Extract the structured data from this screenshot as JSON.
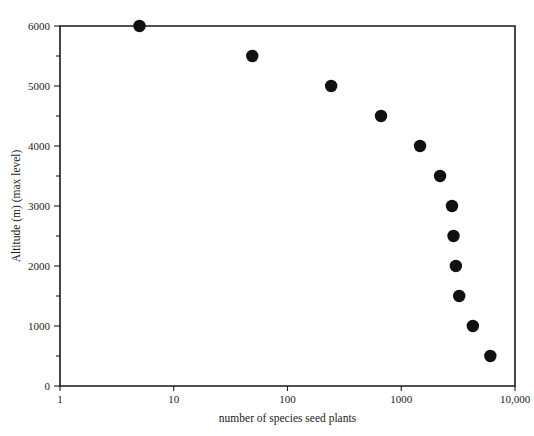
{
  "chart_data": {
    "type": "scatter",
    "title": "",
    "xlabel": "number of species seed plants",
    "ylabel": "Altitude (m) (max level)",
    "x_scale": "log",
    "y_scale": "linear",
    "xlim": [
      1,
      10000
    ],
    "ylim": [
      0,
      6000
    ],
    "grid": false,
    "legend": null,
    "x_ticks": [
      {
        "value": 1,
        "label": "1"
      },
      {
        "value": 10,
        "label": "10"
      },
      {
        "value": 100,
        "label": "100"
      },
      {
        "value": 1000,
        "label": "1000"
      },
      {
        "value": 10000,
        "label": "10,000"
      }
    ],
    "y_ticks": [
      {
        "value": 0,
        "label": "0",
        "minor": false
      },
      {
        "value": 500,
        "label": "",
        "minor": true
      },
      {
        "value": 1000,
        "label": "1000",
        "minor": false
      },
      {
        "value": 1500,
        "label": "",
        "minor": true
      },
      {
        "value": 2000,
        "label": "2000",
        "minor": false
      },
      {
        "value": 2500,
        "label": "",
        "minor": true
      },
      {
        "value": 3000,
        "label": "3000",
        "minor": false
      },
      {
        "value": 3500,
        "label": "",
        "minor": true
      },
      {
        "value": 4000,
        "label": "4000",
        "minor": false
      },
      {
        "value": 4500,
        "label": "",
        "minor": true
      },
      {
        "value": 5000,
        "label": "5000",
        "minor": false
      },
      {
        "value": 5500,
        "label": "",
        "minor": true
      },
      {
        "value": 6000,
        "label": "6000",
        "minor": false
      }
    ],
    "series": [
      {
        "name": "seed plant species by altitude",
        "marker": "filled-circle",
        "color": "#111111",
        "points": [
          {
            "x": 5,
            "y": 6000
          },
          {
            "x": 49,
            "y": 5500
          },
          {
            "x": 242,
            "y": 5000
          },
          {
            "x": 664,
            "y": 4500
          },
          {
            "x": 1463,
            "y": 4000
          },
          {
            "x": 2194,
            "y": 3500
          },
          {
            "x": 2793,
            "y": 3000
          },
          {
            "x": 2880,
            "y": 2500
          },
          {
            "x": 3022,
            "y": 2000
          },
          {
            "x": 3233,
            "y": 1500
          },
          {
            "x": 4260,
            "y": 1000
          },
          {
            "x": 6070,
            "y": 500
          }
        ]
      }
    ]
  }
}
